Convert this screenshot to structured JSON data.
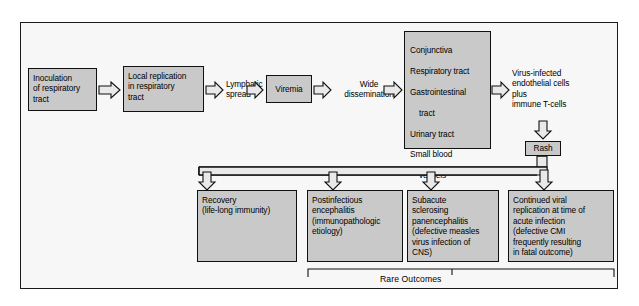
{
  "diagram": {
    "title_caption": "Rare Outcomes",
    "colors": {
      "node_fill": "#c9c9c9",
      "node_border": "#111111",
      "frame_fill": "#f7f7f7",
      "frame_border": "#1a1a1a",
      "arrow_fill": "#e9e9e9",
      "text": "#000000"
    },
    "nodes": {
      "inoculation": "Inoculation\nof respiratory\ntract",
      "local_replication": "Local replication\nin respiratory\ntract",
      "lymphatic_spread": "Lymphatic\nspread",
      "viremia": "Viremia",
      "wide_dissemination": "Wide\ndissemination",
      "target_tissues_line1": "Conjunctiva",
      "target_tissues_line2": "Respiratory tract",
      "target_tissues_line3": "Gastrointestinal",
      "target_tissues_line4": "tract",
      "target_tissues_line5": "Urinary tract",
      "target_tissues_line6": "Small blood",
      "target_tissues_line7": "vessels",
      "target_tissues_line8": "Lymphatics",
      "target_tissues_line9": "Central nervous",
      "target_tissues_line10": "system",
      "virus_infected_cells": "Virus-infected\nendothelial cells\nplus\nimmune T-cells",
      "rash": "Rash",
      "recovery": "Recovery\n(life-long immunity)",
      "postinfectious": "Postinfectious\nencephalitis\n(immunopathologic\netiology)",
      "subacute": "Subacute\nsclerosing\npanencephalitis\n(defective measles\nvirus infection of\nCNS)",
      "continued_viral": "Continued viral\nreplication at time of\nacute infection\n(defective CMI\nfrequently resulting\nin fatal outcome)"
    },
    "icons": {
      "arrow_right": "block-arrow-right-icon",
      "arrow_down": "block-arrow-down-icon",
      "bracket": "bracket-icon"
    }
  }
}
